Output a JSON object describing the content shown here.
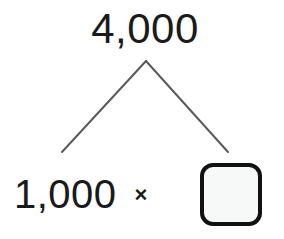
{
  "diagram": {
    "type": "number-bond",
    "title": "",
    "background_color": "#ffffff",
    "whole": {
      "label": "4,000",
      "value": 4000,
      "text_color": "#1a1a1a"
    },
    "operator": {
      "label": "×",
      "name": "multiplication",
      "text_color": "#1a1a1a"
    },
    "parts": [
      {
        "label": "1,000",
        "value": 1000,
        "filled": true,
        "text_color": "#1a1a1a"
      },
      {
        "label": "",
        "value": null,
        "filled": false,
        "box_fill_color": "#f7f8f8",
        "box_border_color": "#111111"
      }
    ],
    "branches": {
      "stroke_color": "#5a5a5a",
      "stroke_width": 2,
      "apex": {
        "x": 146,
        "y": 61
      },
      "left_end": {
        "x": 62,
        "y": 152
      },
      "right_end": {
        "x": 228,
        "y": 152
      }
    }
  }
}
